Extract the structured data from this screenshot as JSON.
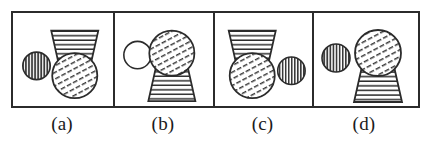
{
  "figure": {
    "caption_labels": [
      "(a)",
      "(b)",
      "(c)",
      "(d)"
    ],
    "stroke_color": "#2b2b2b",
    "fill_color": "#ffffff",
    "panel_count": 4,
    "panels": [
      {
        "label": "(a)",
        "small_circle": {
          "name": "small-circle",
          "fill_pattern": "vertical-stripes",
          "position": "left",
          "diameter_px": 28
        },
        "assembly": {
          "name": "trapezoid-over-circle",
          "position": "right",
          "order_top_to_bottom": [
            "trapezoid",
            "hatched-circle"
          ],
          "trapezoid": {
            "fill_pattern": "horizontal-stripes",
            "wide_edge": "top",
            "top_width_px": 48,
            "bottom_width_px": 30,
            "height_px": 40
          },
          "big_circle": {
            "fill_pattern": "diagonal-hatch",
            "diameter_px": 46
          }
        }
      },
      {
        "label": "(b)",
        "small_circle": {
          "name": "small-circle",
          "fill_pattern": "empty",
          "position": "left",
          "diameter_px": 28
        },
        "assembly": {
          "name": "circle-over-trapezoid",
          "position": "right",
          "order_top_to_bottom": [
            "hatched-circle",
            "trapezoid"
          ],
          "trapezoid": {
            "fill_pattern": "horizontal-stripes",
            "wide_edge": "bottom",
            "top_width_px": 30,
            "bottom_width_px": 48,
            "height_px": 40
          },
          "big_circle": {
            "fill_pattern": "diagonal-hatch",
            "diameter_px": 46
          }
        }
      },
      {
        "label": "(c)",
        "small_circle": {
          "name": "small-circle",
          "fill_pattern": "vertical-stripes",
          "position": "right",
          "diameter_px": 28
        },
        "assembly": {
          "name": "trapezoid-over-circle",
          "position": "left",
          "order_top_to_bottom": [
            "trapezoid",
            "hatched-circle"
          ],
          "trapezoid": {
            "fill_pattern": "horizontal-stripes",
            "wide_edge": "top",
            "top_width_px": 48,
            "bottom_width_px": 30,
            "height_px": 40
          },
          "big_circle": {
            "fill_pattern": "diagonal-hatch",
            "diameter_px": 46
          }
        }
      },
      {
        "label": "(d)",
        "small_circle": {
          "name": "small-circle",
          "fill_pattern": "vertical-stripes",
          "position": "left",
          "diameter_px": 28
        },
        "assembly": {
          "name": "circle-over-trapezoid",
          "position": "right",
          "order_top_to_bottom": [
            "hatched-circle",
            "trapezoid"
          ],
          "trapezoid": {
            "fill_pattern": "horizontal-stripes",
            "wide_edge": "bottom",
            "top_width_px": 30,
            "bottom_width_px": 48,
            "height_px": 40
          },
          "big_circle": {
            "fill_pattern": "diagonal-hatch",
            "diameter_px": 46
          }
        }
      }
    ]
  }
}
